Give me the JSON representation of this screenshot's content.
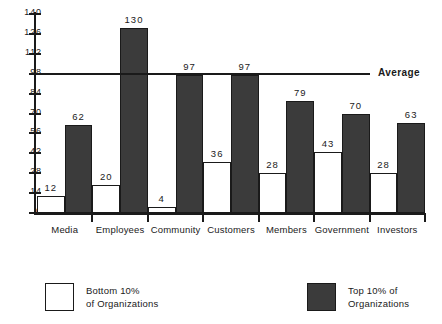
{
  "chart_data": {
    "type": "bar",
    "title": "",
    "subtitle": "",
    "xlabel": "",
    "ylabel": "",
    "categories": [
      "Media",
      "Employees",
      "Community",
      "Customers",
      "Members",
      "Government",
      "Investors"
    ],
    "series": [
      {
        "name": "Bottom 10% of Organizations",
        "values": [
          12,
          20,
          4,
          36,
          28,
          43,
          28
        ],
        "color": "#ffffff"
      },
      {
        "name": "Top 10% of Organizations",
        "values": [
          62,
          130,
          97,
          97,
          79,
          70,
          63
        ],
        "color": "#3b3b3b"
      }
    ],
    "ylim": [
      0,
      140
    ],
    "yticks": [
      0,
      14,
      28,
      42,
      56,
      70,
      84,
      98,
      112,
      126,
      140
    ],
    "grid": false,
    "legend_position": "bottom",
    "annotations": [
      {
        "label": "Average",
        "type": "hline",
        "value": 98
      }
    ]
  },
  "legend": {
    "bottom": {
      "label": "Bottom 10%\nof Organizations",
      "swatch": "light-square-swatch"
    },
    "top": {
      "label": "Top 10% of\nOrganizations",
      "swatch": "dark-square-swatch"
    }
  },
  "colors": {
    "dark_bar": "#3b3b3b",
    "light_bar": "#ffffff",
    "axis": "#1a1a1a",
    "background": "#ffffff"
  }
}
